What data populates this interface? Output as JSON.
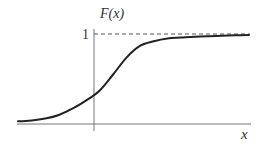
{
  "chart_data": {
    "type": "line",
    "title": "",
    "xlabel": "x",
    "ylabel": "F(x)",
    "y_tick_labels": [
      "1"
    ],
    "asymptote": {
      "y": 1,
      "style": "dashed",
      "label": "1"
    },
    "grid": false,
    "legend": null,
    "series": [
      {
        "name": "F(x)",
        "x": [
          -3.0,
          -2.5,
          -2.0,
          -1.5,
          -1.0,
          -0.5,
          0.0,
          0.5,
          1.0,
          1.5,
          2.0,
          2.5,
          3.0,
          3.5,
          4.0,
          4.5,
          5.0,
          5.5
        ],
        "y": [
          0.03,
          0.04,
          0.06,
          0.1,
          0.17,
          0.26,
          0.37,
          0.55,
          0.74,
          0.87,
          0.92,
          0.95,
          0.96,
          0.97,
          0.975,
          0.98,
          0.985,
          0.99
        ]
      }
    ],
    "xlim": [
      -3.0,
      5.5
    ],
    "ylim": [
      0,
      1.1
    ]
  },
  "labels": {
    "ylabel": "F(x)",
    "one": "1",
    "xlabel": "x"
  },
  "colors": {
    "curve": "#222222",
    "axes": "#666666",
    "dashed": "#555555"
  }
}
